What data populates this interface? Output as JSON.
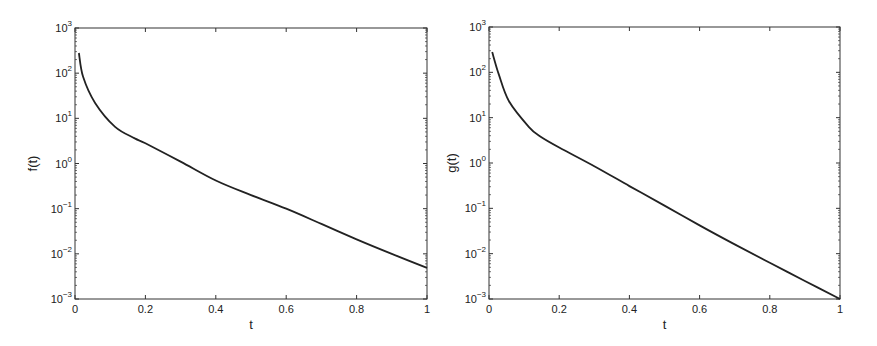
{
  "chart_data": [
    {
      "type": "line",
      "title": "",
      "xlabel": "t",
      "ylabel": "f(t)",
      "yscale": "log",
      "xlim": [
        0,
        1
      ],
      "ylim": [
        0.001,
        1000
      ],
      "grid": false,
      "legend": null,
      "x_ticks": [
        "0",
        "0.2",
        "0.4",
        "0.6",
        "0.8",
        "1"
      ],
      "y_ticks": [
        "10^3",
        "10^2",
        "10^1",
        "10^0",
        "10^-1",
        "10^-2",
        "10^-3"
      ],
      "series": [
        {
          "name": "f(t)",
          "color": "#222222",
          "x": [
            0.011,
            0.023,
            0.057,
            0.114,
            0.17,
            0.2,
            0.3,
            0.4,
            0.5,
            0.6,
            0.7,
            0.8,
            0.9,
            1.0
          ],
          "y": [
            280,
            83,
            22,
            6.5,
            3.6,
            2.8,
            1.1,
            0.42,
            0.2,
            0.1,
            0.046,
            0.021,
            0.01,
            0.0049
          ]
        }
      ]
    },
    {
      "type": "line",
      "title": "",
      "xlabel": "t",
      "ylabel": "g(t)",
      "yscale": "log",
      "xlim": [
        0,
        1
      ],
      "ylim": [
        0.001,
        1000
      ],
      "grid": false,
      "legend": null,
      "x_ticks": [
        "0",
        "0.2",
        "0.4",
        "0.6",
        "0.8",
        "1"
      ],
      "y_ticks": [
        "10^3",
        "10^2",
        "10^1",
        "10^0",
        "10^-1",
        "10^-2",
        "10^-3"
      ],
      "series": [
        {
          "name": "g(t)",
          "color": "#222222",
          "x": [
            0.009,
            0.028,
            0.057,
            0.114,
            0.145,
            0.2,
            0.3,
            0.4,
            0.5,
            0.6,
            0.7,
            0.8,
            0.9,
            1.0
          ],
          "y": [
            280,
            90,
            23,
            6.2,
            3.9,
            2.2,
            0.85,
            0.31,
            0.115,
            0.042,
            0.016,
            0.0063,
            0.0025,
            0.001
          ]
        }
      ]
    }
  ],
  "layout": {
    "panels": [
      {
        "left": 75,
        "top": 28,
        "right": 427,
        "bottom": 299,
        "ylabel_x": 37
      },
      {
        "left": 489,
        "top": 27,
        "right": 840,
        "bottom": 299,
        "ylabel_x": 456
      }
    ],
    "axis_color": "#333333",
    "line_color": "#222222"
  }
}
